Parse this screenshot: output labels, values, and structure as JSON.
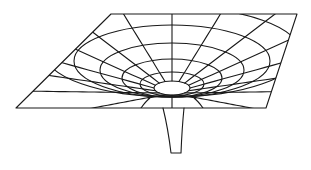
{
  "diagram": {
    "colors": {
      "background": "#ffffff",
      "line": "#1a1a1a"
    },
    "sheet": {
      "corners": {
        "top_left": [
          111,
          14
        ],
        "top_right": [
          297,
          14
        ],
        "bottom_right": [
          266,
          108
        ],
        "bottom_left": [
          16,
          108
        ]
      }
    },
    "well_center": [
      170,
      92
    ],
    "rings": [
      {
        "cx": 172,
        "cy": 88,
        "rx": 18,
        "ry": 7
      },
      {
        "cx": 172,
        "cy": 84,
        "rx": 32,
        "ry": 12
      },
      {
        "cx": 172,
        "cy": 78,
        "rx": 50,
        "ry": 19
      },
      {
        "cx": 172,
        "cy": 70,
        "rx": 72,
        "ry": 27
      },
      {
        "cx": 172,
        "cy": 61,
        "rx": 98,
        "ry": 36
      },
      {
        "cx": 172,
        "cy": 52,
        "rx": 128,
        "ry": 45
      }
    ],
    "spoke_count": 16,
    "throat": {
      "top_y": 108,
      "bottom_y": 153,
      "top_left_x": 163,
      "top_right_x": 184,
      "bottom_left_x": 171,
      "bottom_right_x": 181
    }
  }
}
